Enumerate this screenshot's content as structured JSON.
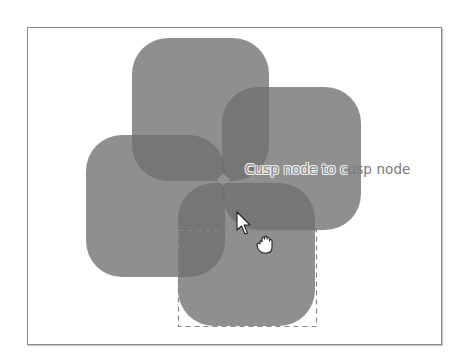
{
  "frame": {
    "border_color": "#8a8a8a",
    "background": "#ffffff"
  },
  "shapes": {
    "fill": "#707070",
    "opacity": 0.78,
    "items": [
      {
        "name": "top-rounded-square",
        "x": 132,
        "y": 38,
        "w": 137,
        "h": 143,
        "r": 36
      },
      {
        "name": "right-rounded-square",
        "x": 222,
        "y": 87,
        "w": 139,
        "h": 143,
        "r": 36
      },
      {
        "name": "left-rounded-square",
        "x": 86,
        "y": 135,
        "w": 139,
        "h": 142,
        "r": 36
      },
      {
        "name": "bottom-rounded-square",
        "x": 178,
        "y": 183,
        "w": 137,
        "h": 143,
        "r": 36
      }
    ]
  },
  "selection_box": {
    "x": 178,
    "y": 230,
    "w": 138,
    "h": 97,
    "stroke": "#888888"
  },
  "snap_indicator": {
    "text_outlined": "Cusp node to c",
    "text_plain": "usp node",
    "full_text": "Cusp node to cusp node",
    "node_position": [
      224,
      180
    ]
  },
  "cursors": {
    "pointer": "arrow-pointer",
    "grab": "grab-hand"
  }
}
